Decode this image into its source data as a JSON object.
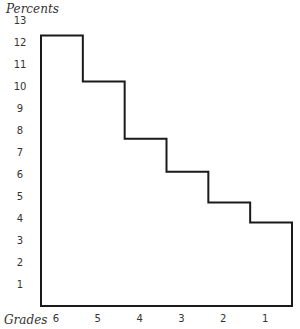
{
  "chart_data": {
    "type": "bar",
    "style": "hand-drawn step histogram",
    "title": "",
    "ylabel": "Percents",
    "xlabel": "Grades",
    "categories": [
      "6",
      "5",
      "4",
      "3",
      "2",
      "1"
    ],
    "values": [
      12.3,
      10.2,
      7.6,
      6.1,
      4.7,
      3.8
    ],
    "ylim": [
      0,
      13
    ],
    "yticks": [
      "1",
      "2",
      "3",
      "4",
      "5",
      "6",
      "7",
      "8",
      "9",
      "10",
      "11",
      "12",
      "13"
    ],
    "grid": false,
    "legend": null,
    "line_color": "#1a1a1a"
  }
}
